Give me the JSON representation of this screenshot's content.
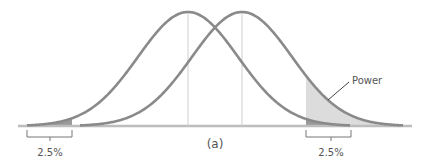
{
  "figure": {
    "panel_label": "(a)",
    "left_tail_label": "2.5%",
    "right_tail_label": "2.5%",
    "power_label": "Power"
  },
  "colors": {
    "curve": "#8a8a8a",
    "axis": "#bdbdbd",
    "center_line": "#cfcfcf",
    "alpha_fill": "#9a9a9a",
    "power_fill": "#dcdcdc",
    "bracket": "#777777",
    "text": "#555555"
  },
  "geometry": {
    "baseline_y": 126,
    "axis_x": [
      18,
      412
    ],
    "null_mean_x": 188,
    "alt_mean_x": 242,
    "sigma_px": 50,
    "peak_height_px": 114,
    "left_critical_x": 72,
    "right_critical_x": 306
  }
}
